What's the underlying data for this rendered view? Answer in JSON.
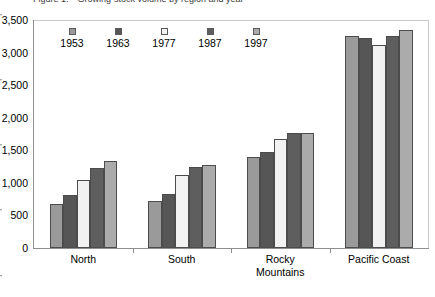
{
  "caption": {
    "clipped_top_text": "Figure 1.—Growing-stock volume by region and year"
  },
  "chart_data": {
    "type": "bar",
    "title": "",
    "subtitle": "",
    "xlabel": "",
    "ylabel": "",
    "categories": [
      "North",
      "South",
      "Rocky\nMountains",
      "Pacific Coast"
    ],
    "series": [
      {
        "name": "1953",
        "color": "#9a9a9a",
        "values": [
          670,
          720,
          1400,
          3250
        ]
      },
      {
        "name": "1963",
        "color": "#565656",
        "values": [
          810,
          830,
          1480,
          3230
        ]
      },
      {
        "name": "1977",
        "color": "#f2f2f2",
        "values": [
          1050,
          1120,
          1680,
          3120
        ]
      },
      {
        "name": "1987",
        "color": "#5e5e5e",
        "values": [
          1230,
          1250,
          1760,
          3250
        ]
      },
      {
        "name": "1997",
        "color": "#ababab",
        "values": [
          1340,
          1270,
          1760,
          3340
        ]
      }
    ],
    "ylim": [
      0,
      3500
    ],
    "ytick_values": [
      0,
      500,
      1000,
      1500,
      2000,
      2500,
      3000,
      3500
    ],
    "ytick_labels": [
      "0",
      "500",
      "1,000",
      "1,500",
      "2,000",
      "2,500",
      "3,000",
      "3,500"
    ],
    "grid": false,
    "legend_position": "inside-top-left",
    "bar_edge_color": "#4c4c4c",
    "axis_color": "#8f8f8f"
  }
}
